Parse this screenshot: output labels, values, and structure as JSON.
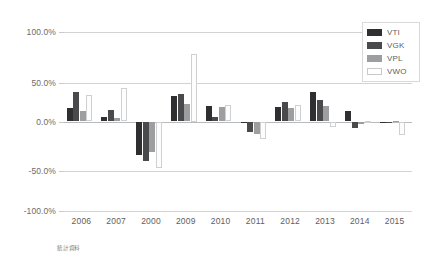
{
  "chart_data": {
    "type": "bar",
    "title": "",
    "subtitle": "",
    "xlabel": "",
    "ylabel": "",
    "categories": [
      "2006",
      "2007",
      "2000",
      "2009",
      "2010",
      "2011",
      "2012",
      "2013",
      "2014",
      "2015"
    ],
    "series": [
      {
        "name": "VTI",
        "color": "#2f2f31",
        "values": [
          15.5,
          5.0,
          -37.0,
          28.5,
          17.0,
          -0.5,
          16.0,
          33.5,
          11.5,
          -1.0
        ]
      },
      {
        "name": "VGK",
        "color": "#4a4a4c",
        "values": [
          33.5,
          13.0,
          -44.5,
          31.0,
          5.0,
          -11.5,
          21.5,
          24.0,
          -7.0,
          -1.5
        ]
      },
      {
        "name": "VPL",
        "color": "#9d9ea0",
        "values": [
          12.0,
          3.5,
          -34.5,
          20.0,
          16.5,
          -14.5,
          15.5,
          17.0,
          -3.0,
          0.5
        ]
      },
      {
        "name": "VWO",
        "color": "#ffffff",
        "values": [
          29.5,
          37.0,
          -52.5,
          75.0,
          18.5,
          -19.5,
          18.5,
          -6.5,
          0.5,
          -15.5
        ]
      }
    ],
    "ylim": [
      -100,
      100
    ],
    "yticks": [
      100,
      50,
      0,
      -50,
      -100
    ],
    "ytick_labels": [
      "100.0%",
      "50.0%",
      "0.0%",
      "-50.0%",
      "-100.0%"
    ],
    "grid": true,
    "legend_position": "top-right",
    "legend_entries": [
      "VTI",
      "VGK",
      "VPL",
      "VWO"
    ]
  },
  "caption": {
    "text": "統計資料"
  }
}
